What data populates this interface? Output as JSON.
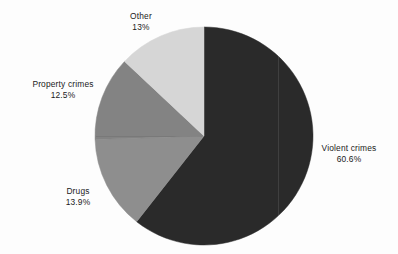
{
  "background_color": "#fdfdfd",
  "text_color": "#1b1b1b",
  "chart_data": {
    "type": "pie",
    "title": "",
    "subtitle": "",
    "xlabel": "",
    "ylabel": "",
    "legend_position": "none",
    "labels_position": "outside",
    "start_angle_deg": 0,
    "direction": "clockwise",
    "center": {
      "x": 204,
      "y": 136
    },
    "radius": 109,
    "categories": [
      "Violent crimes",
      "Drugs",
      "Property crimes",
      "Other"
    ],
    "values": [
      60.6,
      13.9,
      12.5,
      13.0
    ],
    "value_labels": [
      "60.6%",
      "13.9%",
      "12.5%",
      "13%"
    ],
    "colors": [
      "#2a2a2a",
      "#8e8e8e",
      "#838383",
      "#d6d6d6"
    ],
    "slices": [
      {
        "name": "Violent crimes",
        "value": 60.6,
        "value_label": "60.6%",
        "color": "#2a2a2a",
        "start_deg": 0,
        "end_deg": 218.16
      },
      {
        "name": "Drugs",
        "value": 13.9,
        "value_label": "13.9%",
        "color": "#8e8e8e",
        "start_deg": 218.16,
        "end_deg": 268.2
      },
      {
        "name": "Property crimes",
        "value": 12.5,
        "value_label": "12.5%",
        "color": "#838383",
        "start_deg": 268.2,
        "end_deg": 313.2
      },
      {
        "name": "Other",
        "value": 13.0,
        "value_label": "13%",
        "color": "#d6d6d6",
        "start_deg": 313.2,
        "end_deg": 360
      }
    ]
  },
  "labels": {
    "other": {
      "name": "Other",
      "value": "13%"
    },
    "property": {
      "name": "Property crimes",
      "value": "12.5%"
    },
    "drugs": {
      "name": "Drugs",
      "value": "13.9%"
    },
    "violent": {
      "name": "Violent crimes",
      "value": "60.6%"
    }
  }
}
